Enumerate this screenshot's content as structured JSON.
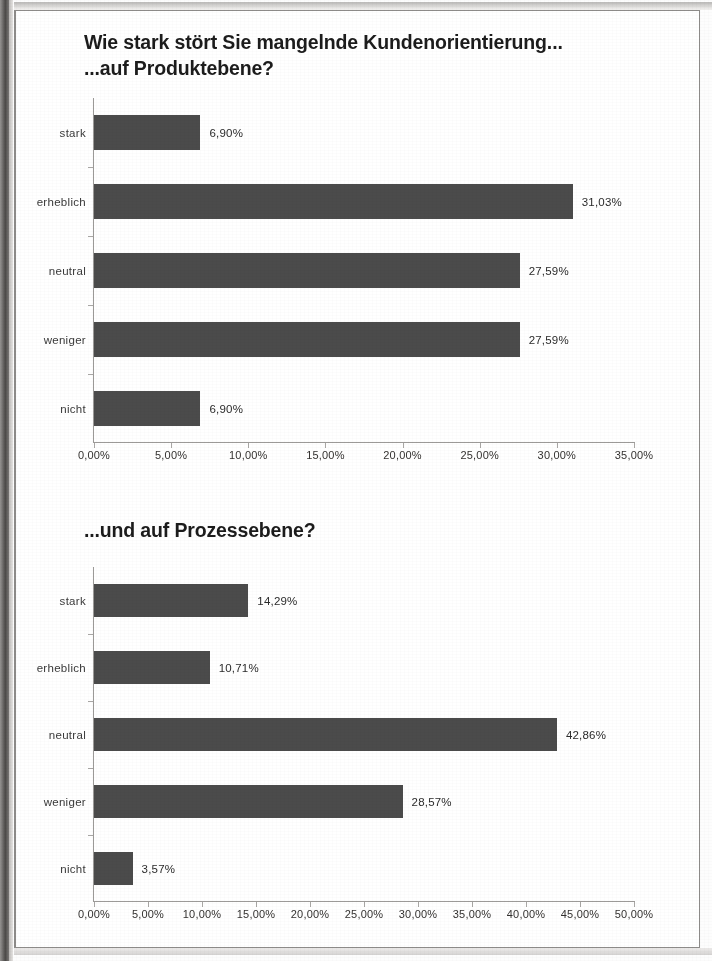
{
  "document": {
    "kind": "scanned-slide",
    "background_color": "#fdfdfd",
    "frame_color": "#8d8b89"
  },
  "charts": [
    {
      "id": "chart-1",
      "title": "Wie stark stört Sie mangelnde Kundenorientierung...\n...auf Produktebene?",
      "title_line_1": "Wie stark stört Sie mangelnde Kundenorientierung...",
      "title_line_2": "...auf Produktebene?",
      "bar_color": "#4b4b4b",
      "axis_tick_labels": [
        "0,00%",
        "5,00%",
        "10,00%",
        "15,00%",
        "20,00%",
        "25,00%",
        "30,00%",
        "35,00%"
      ],
      "rows": [
        {
          "label": "stark",
          "value_label": "6,90%",
          "value": 6.9
        },
        {
          "label": "erheblich",
          "value_label": "31,03%",
          "value": 31.03
        },
        {
          "label": "neutral",
          "value_label": "27,59%",
          "value": 27.59
        },
        {
          "label": "weniger",
          "value_label": "27,59%",
          "value": 27.59
        },
        {
          "label": "nicht",
          "value_label": "6,90%",
          "value": 6.9
        }
      ]
    },
    {
      "id": "chart-2",
      "title": "...und auf Prozessebene?",
      "title_line_1": "...und auf Prozessebene?",
      "title_line_2": "",
      "bar_color": "#4b4b4b",
      "axis_tick_labels": [
        "0,00%",
        "5,00%",
        "10,00%",
        "15,00%",
        "20,00%",
        "25,00%",
        "30,00%",
        "35,00%",
        "40,00%",
        "45,00%",
        "50,00%"
      ],
      "rows": [
        {
          "label": "stark",
          "value_label": "14,29%",
          "value": 14.29
        },
        {
          "label": "erheblich",
          "value_label": "10,71%",
          "value": 10.71
        },
        {
          "label": "neutral",
          "value_label": "42,86%",
          "value": 42.86
        },
        {
          "label": "weniger",
          "value_label": "28,57%",
          "value": 28.57
        },
        {
          "label": "nicht",
          "value_label": "3,57%",
          "value": 3.57
        }
      ]
    }
  ],
  "chart_data": [
    {
      "type": "bar",
      "orientation": "horizontal",
      "title": "Wie stark stört Sie mangelnde Kundenorientierung... ...auf Produktebene?",
      "subtitle": "...auf Produktebene?",
      "xlabel": "",
      "ylabel": "",
      "categories": [
        "stark",
        "erheblich",
        "neutral",
        "weniger",
        "nicht"
      ],
      "values": [
        6.9,
        31.03,
        27.59,
        27.59,
        6.9
      ],
      "value_labels": [
        "6,90%",
        "31,03%",
        "27,59%",
        "27,59%",
        "6,90%"
      ],
      "xlim": [
        0,
        35
      ],
      "xticks": [
        0,
        5,
        10,
        15,
        20,
        25,
        30,
        35
      ],
      "xticklabels": [
        "0,00%",
        "5,00%",
        "10,00%",
        "15,00%",
        "20,00%",
        "25,00%",
        "30,00%",
        "35,00%"
      ],
      "grid": false,
      "legend": false,
      "series_color": "#4b4b4b"
    },
    {
      "type": "bar",
      "orientation": "horizontal",
      "title": "...und auf Prozessebene?",
      "subtitle": "",
      "xlabel": "",
      "ylabel": "",
      "categories": [
        "stark",
        "erheblich",
        "neutral",
        "weniger",
        "nicht"
      ],
      "values": [
        14.29,
        10.71,
        42.86,
        28.57,
        3.57
      ],
      "value_labels": [
        "14,29%",
        "10,71%",
        "42,86%",
        "28,57%",
        "3,57%"
      ],
      "xlim": [
        0,
        50
      ],
      "xticks": [
        0,
        5,
        10,
        15,
        20,
        25,
        30,
        35,
        40,
        45,
        50
      ],
      "xticklabels": [
        "0,00%",
        "5,00%",
        "10,00%",
        "15,00%",
        "20,00%",
        "25,00%",
        "30,00%",
        "35,00%",
        "40,00%",
        "45,00%",
        "50,00%"
      ],
      "grid": false,
      "legend": false,
      "series_color": "#4b4b4b"
    }
  ]
}
